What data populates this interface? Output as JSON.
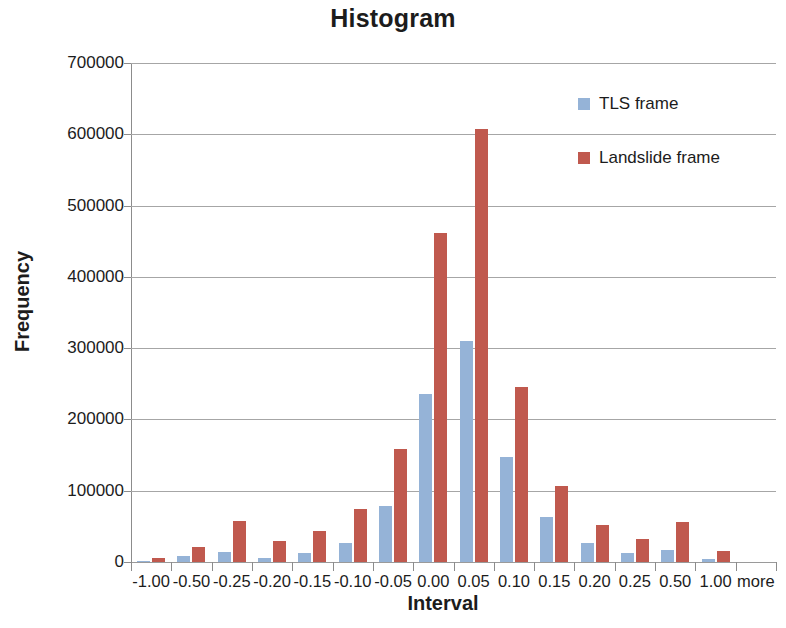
{
  "chart_data": {
    "type": "bar",
    "title": "Histogram",
    "xlabel": "Interval",
    "ylabel": "Frequency",
    "categories": [
      "-1.00",
      "-0.50",
      "-0.25",
      "-0.20",
      "-0.15",
      "-0.10",
      "-0.05",
      "0.00",
      "0.05",
      "0.10",
      "0.15",
      "0.20",
      "0.25",
      "0.50",
      "1.00",
      "more"
    ],
    "series": [
      {
        "name": "TLS frame",
        "color": "#95b3d7",
        "values": [
          1000,
          8000,
          14000,
          6000,
          13000,
          27000,
          78000,
          235000,
          310000,
          148000,
          63000,
          27000,
          12000,
          17000,
          4000,
          0
        ]
      },
      {
        "name": "Landslide frame",
        "color": "#c0594e",
        "values": [
          6000,
          21000,
          57000,
          30000,
          43000,
          75000,
          158000,
          462000,
          608000,
          246000,
          106000,
          52000,
          32000,
          56000,
          16000,
          0
        ]
      }
    ],
    "ylim": [
      0,
      700000
    ],
    "ytick_values": [
      0,
      100000,
      200000,
      300000,
      400000,
      500000,
      600000,
      700000
    ],
    "ytick_labels": [
      "0",
      "100000",
      "200000",
      "300000",
      "400000",
      "500000",
      "600000",
      "700000"
    ],
    "grid": true,
    "grid_axis": "y",
    "legend_position": "upper right"
  }
}
